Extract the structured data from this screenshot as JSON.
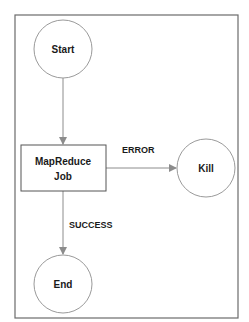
{
  "diagram": {
    "type": "workflow",
    "colors": {
      "frame": "#6b6b6b",
      "node_stroke": "#9a9a9a",
      "box_stroke": "#555555",
      "edge": "#8c8c8c",
      "text": "#1a1a1a"
    },
    "nodes": [
      {
        "id": "start",
        "shape": "circle",
        "label": "Start"
      },
      {
        "id": "job",
        "shape": "rect",
        "label_line1": "MapReduce",
        "label_line2": "Job"
      },
      {
        "id": "kill",
        "shape": "circle",
        "label": "Kill"
      },
      {
        "id": "end",
        "shape": "circle",
        "label": "End"
      }
    ],
    "edges": [
      {
        "from": "start",
        "to": "job",
        "label": ""
      },
      {
        "from": "job",
        "to": "kill",
        "label": "ERROR"
      },
      {
        "from": "job",
        "to": "end",
        "label": "SUCCESS"
      }
    ]
  }
}
